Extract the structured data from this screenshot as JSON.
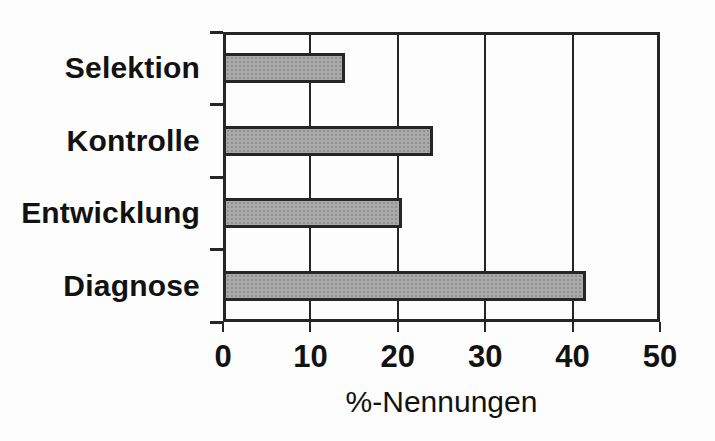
{
  "chart_data": {
    "type": "bar",
    "orientation": "horizontal",
    "categories": [
      "Selektion",
      "Kontrolle",
      "Entwicklung",
      "Diagnose"
    ],
    "values": [
      14,
      24,
      20.5,
      41.5
    ],
    "xlabel": "%-Nennungen",
    "xlim": [
      0,
      50
    ],
    "xticks": [
      0,
      10,
      20,
      30,
      40,
      50
    ],
    "grid": true,
    "legend": false,
    "colors": {
      "bar_fill": "#a9a9a9",
      "bar_border": "#262626",
      "axis": "#262626",
      "text": "#121212",
      "background": "#fdfdfd"
    }
  }
}
